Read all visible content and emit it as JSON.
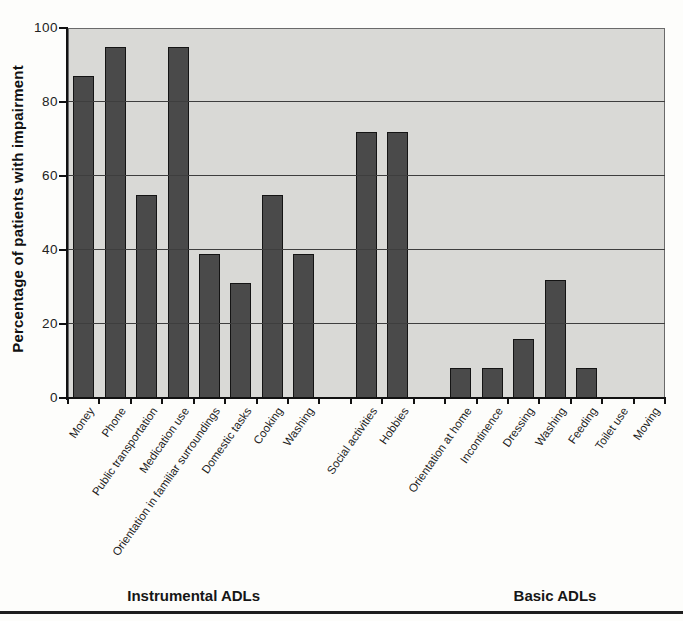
{
  "chart_data": {
    "type": "bar",
    "title": "",
    "ylabel": "Percentage of patients with impairment",
    "xlabel": "",
    "ylim": [
      0,
      100
    ],
    "yticks": [
      0,
      20,
      40,
      60,
      80,
      100
    ],
    "grid": true,
    "legend": false,
    "categories": [
      "Money",
      "Phone",
      "Public transportation",
      "Medication use",
      "Orientation in familiar surroundings",
      "Domestic tasks",
      "Cooking",
      "Washing",
      "Social activities",
      "Hobbies",
      "Orientation at home",
      "Incontinence",
      "Dressing",
      "Washing",
      "Feeding",
      "Toilet use",
      "Moving"
    ],
    "values": [
      87,
      95,
      55,
      95,
      39,
      31,
      55,
      39,
      72,
      72,
      8,
      8,
      16,
      32,
      8,
      0,
      0
    ],
    "slots": [
      {
        "label": "Money",
        "value": 87
      },
      {
        "label": "Phone",
        "value": 95
      },
      {
        "label": "Public transportation",
        "value": 55
      },
      {
        "label": "Medication use",
        "value": 95
      },
      {
        "label": "Orientation in familiar surroundings",
        "value": 39
      },
      {
        "label": "Domestic tasks",
        "value": 31
      },
      {
        "label": "Cooking",
        "value": 55
      },
      {
        "label": "Washing",
        "value": 39
      },
      {
        "label": null,
        "value": null
      },
      {
        "label": "Social activities",
        "value": 72
      },
      {
        "label": "Hobbies",
        "value": 72
      },
      {
        "label": null,
        "value": null
      },
      {
        "label": "Orientation at home",
        "value": 8
      },
      {
        "label": "Incontinence",
        "value": 8
      },
      {
        "label": "Dressing",
        "value": 16
      },
      {
        "label": "Washing",
        "value": 32
      },
      {
        "label": "Feeding",
        "value": 8
      },
      {
        "label": "Toilet use",
        "value": 0
      },
      {
        "label": "Moving",
        "value": 0
      }
    ],
    "group_labels": [
      {
        "label": "Instrumental ADLs",
        "from_slot": 0,
        "to_slot": 7
      },
      {
        "label": "Basic ADLs",
        "from_slot": 12,
        "to_slot": 18
      }
    ],
    "colors": {
      "bar": "#4a4a4a",
      "bar_border": "#141414",
      "plot_background": "#d9d9d6",
      "gridline": "#3e3e3e",
      "axis": "#111111",
      "page_background": "#fdfdfb"
    }
  }
}
